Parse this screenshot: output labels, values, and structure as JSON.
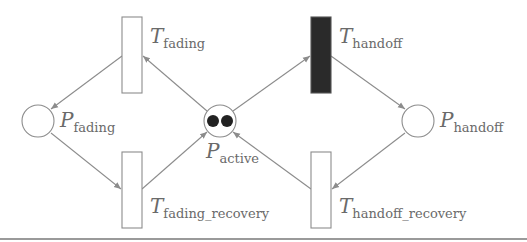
{
  "diagram": {
    "type": "petri-net",
    "colors": {
      "stroke": "#8c8c8c",
      "label": "#6a6a6a",
      "token": "#222222",
      "fired_transition": "#2a2a2a",
      "background": "#ffffff"
    },
    "places": [
      {
        "id": "P_fading",
        "main": "P",
        "sub": "fading",
        "tokens": 0
      },
      {
        "id": "P_active",
        "main": "P",
        "sub": "active",
        "tokens": 2
      },
      {
        "id": "P_handoff",
        "main": "P",
        "sub": "handoff",
        "tokens": 0
      }
    ],
    "transitions": [
      {
        "id": "T_fading",
        "main": "T",
        "sub": "fading",
        "filled": false
      },
      {
        "id": "T_handoff",
        "main": "T",
        "sub": "handoff",
        "filled": true
      },
      {
        "id": "T_fading_recovery",
        "main": "T",
        "sub": "fading_recovery",
        "filled": false
      },
      {
        "id": "T_handoff_recovery",
        "main": "T",
        "sub": "handoff_recovery",
        "filled": false
      }
    ],
    "arcs": [
      {
        "from": "P_active",
        "to": "T_fading"
      },
      {
        "from": "T_fading",
        "to": "P_fading"
      },
      {
        "from": "P_fading",
        "to": "T_fading_recovery"
      },
      {
        "from": "T_fading_recovery",
        "to": "P_active"
      },
      {
        "from": "P_active",
        "to": "T_handoff"
      },
      {
        "from": "T_handoff",
        "to": "P_handoff"
      },
      {
        "from": "P_handoff",
        "to": "T_handoff_recovery"
      },
      {
        "from": "T_handoff_recovery",
        "to": "P_active"
      }
    ]
  }
}
